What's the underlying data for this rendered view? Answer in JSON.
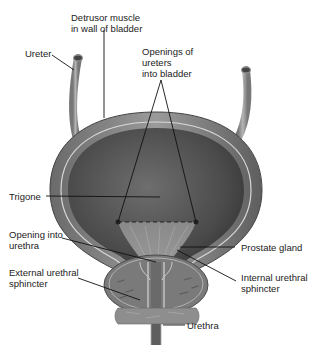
{
  "diagram": {
    "labels": {
      "detrusor": "Detrusor muscle\nin wall of bladder",
      "ureter": "Ureter",
      "openings_ureters": "Openings of\nureters\ninto bladder",
      "trigone": "Trigone",
      "opening_urethra": "Opening into\nurethra",
      "prostate": "Prostate gland",
      "external_sphincter": "External urethral\nsphincter",
      "internal_sphincter": "Internal urethral\nsphincter",
      "urethra": "Urethra"
    },
    "colors": {
      "wall_outer": "#8a8a8a",
      "wall_inner": "#a9a9a9",
      "lumen": "#555555",
      "prostate": "#7e7e7e",
      "leader_line": "#111111",
      "text": "#222222"
    }
  }
}
